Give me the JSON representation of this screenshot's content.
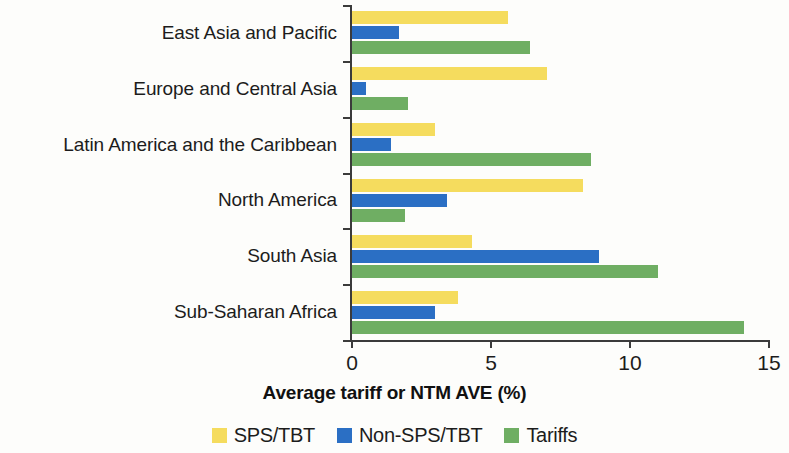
{
  "chart_data": {
    "type": "bar",
    "orientation": "horizontal",
    "title": "",
    "xlabel": "Average tariff or NTM AVE (%)",
    "ylabel": "",
    "xlim": [
      0,
      15
    ],
    "xticks": [
      0,
      5,
      10,
      15
    ],
    "xtick_labels": [
      "0",
      "5",
      "10",
      "15"
    ],
    "grid": false,
    "legend_position": "bottom",
    "categories": [
      "East Asia and Pacific",
      "Europe and Central Asia",
      "Latin America and the Caribbean",
      "North America",
      "South Asia",
      "Sub-Saharan Africa"
    ],
    "series": [
      {
        "name": "SPS/TBT",
        "color": "#F5DC5E",
        "values": [
          5.6,
          7.0,
          3.0,
          8.3,
          4.3,
          3.8
        ]
      },
      {
        "name": "Non-SPS/TBT",
        "color": "#2B6FC4",
        "values": [
          1.7,
          0.5,
          1.4,
          3.4,
          8.9,
          3.0
        ]
      },
      {
        "name": "Tariffs",
        "color": "#6FAE63",
        "values": [
          6.4,
          2.0,
          8.6,
          1.9,
          11.0,
          14.1
        ]
      }
    ]
  },
  "colors": {
    "sps_tbt": "#F5DC5E",
    "non_sps_tbt": "#2B6FC4",
    "tariffs": "#6FAE63",
    "axis": "#3b3b3b",
    "background": "#fdfdfb"
  }
}
